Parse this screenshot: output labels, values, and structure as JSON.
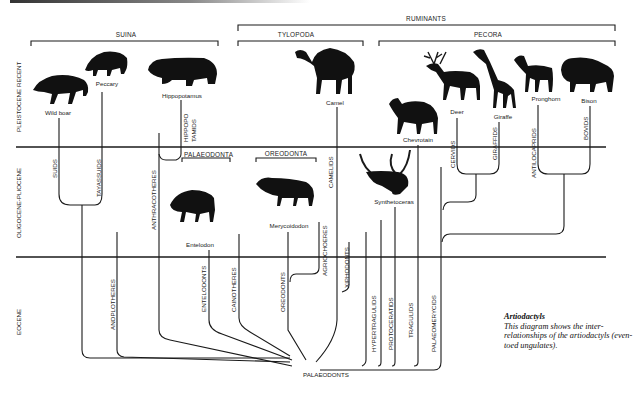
{
  "diagram": {
    "title": "Artiodactyls",
    "caption": "This diagram shows the inter-relationships of the artiodactyls (even-toed ungulates).",
    "root": "PALAEODONTS",
    "epochs": [
      {
        "label": "PLEISTOCENE RECENT"
      },
      {
        "label": "OLIGOCENE-PLIOCENE"
      },
      {
        "label": "EOCENE"
      }
    ],
    "clades": {
      "ruminants": "RUMINANTS",
      "suina": "SUINA",
      "tylopoda": "TYLOPODA",
      "pecora": "PECORA",
      "palaeodonta": "PALAEODONTA",
      "oreodonta": "OREODONTA"
    },
    "animals": {
      "wild_boar": "Wild boar",
      "peccary": "Peccary",
      "hippopotamus": "Hippopotamus",
      "camel": "Camel",
      "chevrotain": "Chevrotain",
      "deer": "Deer",
      "giraffe": "Giraffe",
      "pronghorn": "Pronghorn",
      "bison": "Bison",
      "entelodon": "Entelodon",
      "merycoidodon": "Merycoidodon",
      "synthetoceras": "Synthetoceras"
    },
    "lineages": {
      "suids": "SUIDS",
      "tayassuids": "TAYASSUIDS",
      "hippo1": "HIPPOPO",
      "hippo2": "TAMIDS",
      "anthracotheres": "ANTHRACOTHERES",
      "anoplotheres": "ANOPLOTHERES",
      "entelodonts": "ENTELODONTS",
      "cainotheres": "CAINOTHERES",
      "oreodonts": "OREODONTS",
      "agriochoeres": "AGRIOCHOERES",
      "camelids": "CAMELIDS",
      "xiphodonts": "XIPHODONTS",
      "hypertragulids": "HYPERTRAGULIDS",
      "protoceratids": "PROTOCERATIDS",
      "tragulids": "TRAGULIDS",
      "palaeomerycids": "PALAEOMERYCIDS",
      "cervids": "CERVIDS",
      "giraffids": "GIRAFFIDS",
      "antilocaprids": "ANTILOCAPRIDS",
      "bovids": "BOVIDS"
    }
  }
}
